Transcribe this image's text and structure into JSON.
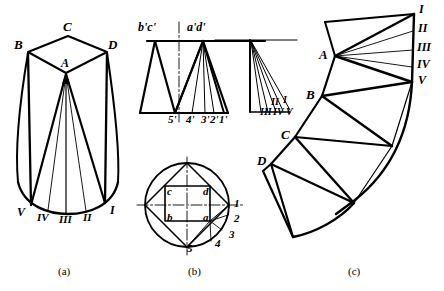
{
  "figure": {
    "stroke_color": "#000000",
    "background_color": "#ffffff",
    "panels": [
      {
        "key": "a",
        "caption": "(a)",
        "description": "Pictorial view of truncated oblique solid with apex A and rim points V, IV, III, II, I",
        "labels": [
          {
            "text": "C",
            "x": 63,
            "y": 27
          },
          {
            "text": "B",
            "x": 16,
            "y": 45
          },
          {
            "text": "D",
            "x": 108,
            "y": 45
          },
          {
            "text": "A",
            "x": 61,
            "y": 63
          },
          {
            "text": "V",
            "x": 19,
            "y": 212
          },
          {
            "text": "IV",
            "x": 39,
            "y": 218
          },
          {
            "text": "III",
            "x": 61,
            "y": 220
          },
          {
            "text": "II",
            "x": 84,
            "y": 218
          },
          {
            "text": "I",
            "x": 110,
            "y": 210
          }
        ]
      },
      {
        "key": "b",
        "caption": "(b)",
        "description": "Orthographic front view and top view (circle with inscribed square) of the solid",
        "labels": [
          {
            "text": "b'c'",
            "x": 140,
            "y": 28
          },
          {
            "text": "a'd'",
            "x": 189,
            "y": 28
          },
          {
            "text": "5'",
            "x": 167,
            "y": 118
          },
          {
            "text": "4'",
            "x": 186,
            "y": 118
          },
          {
            "text": "3'",
            "x": 202,
            "y": 118
          },
          {
            "text": "2'",
            "x": 211,
            "y": 118
          },
          {
            "text": "1'",
            "x": 220,
            "y": 118
          },
          {
            "text": "II",
            "x": 272,
            "y": 103
          },
          {
            "text": "I",
            "x": 283,
            "y": 101
          },
          {
            "text": "III",
            "x": 262,
            "y": 113
          },
          {
            "text": "IV",
            "x": 274,
            "y": 113
          },
          {
            "text": "V",
            "x": 286,
            "y": 113
          },
          {
            "text": "c",
            "x": 167,
            "y": 192
          },
          {
            "text": "d",
            "x": 207,
            "y": 192
          },
          {
            "text": "b",
            "x": 167,
            "y": 225
          },
          {
            "text": "a",
            "x": 207,
            "y": 225
          },
          {
            "text": "1",
            "x": 237,
            "y": 202
          },
          {
            "text": "2",
            "x": 236,
            "y": 218
          },
          {
            "text": "3",
            "x": 232,
            "y": 234
          },
          {
            "text": "4",
            "x": 219,
            "y": 243
          },
          {
            "text": "5",
            "x": 191,
            "y": 247
          }
        ]
      },
      {
        "key": "c",
        "caption": "(c)",
        "description": "Unrolled surface development (flat pattern) with vertices A, B, C, D and rim divisions I-V",
        "labels": [
          {
            "text": "I",
            "x": 419,
            "y": 8
          },
          {
            "text": "II",
            "x": 419,
            "y": 28
          },
          {
            "text": "III",
            "x": 419,
            "y": 47
          },
          {
            "text": "IV",
            "x": 419,
            "y": 64
          },
          {
            "text": "V",
            "x": 419,
            "y": 80
          },
          {
            "text": "A",
            "x": 330,
            "y": 45
          },
          {
            "text": "B",
            "x": 312,
            "y": 89
          },
          {
            "text": "C",
            "x": 287,
            "y": 130
          },
          {
            "text": "D",
            "x": 263,
            "y": 157
          }
        ]
      }
    ],
    "captions": [
      {
        "text": "(a)",
        "x": 68,
        "y": 272
      },
      {
        "text": "(b)",
        "x": 196,
        "y": 272
      },
      {
        "text": "(c)",
        "x": 355,
        "y": 272
      }
    ]
  }
}
